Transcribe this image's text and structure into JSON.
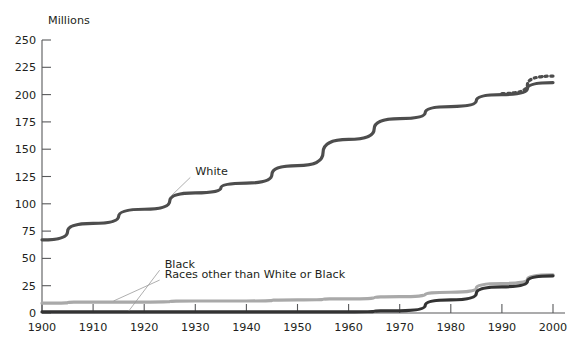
{
  "chart_data": {
    "type": "line",
    "title": "",
    "ylabel": "Millions",
    "xlabel": "",
    "ylim": [
      0,
      250
    ],
    "xlim": [
      1900,
      2000
    ],
    "grid": false,
    "legend_position": "inline-annotations",
    "x": [
      1900,
      1910,
      1920,
      1930,
      1940,
      1950,
      1960,
      1970,
      1980,
      1990,
      2000
    ],
    "yticks": [
      0,
      25,
      50,
      75,
      100,
      125,
      150,
      175,
      200,
      225,
      250
    ],
    "ytick_labels": [
      "0",
      "25",
      "50",
      "75",
      "100",
      "125",
      "150",
      "175",
      "200",
      "225",
      "250"
    ],
    "xticks": [
      1900,
      1910,
      1920,
      1930,
      1940,
      1950,
      1960,
      1970,
      1980,
      1990,
      2000
    ],
    "xtick_labels": [
      "1900",
      "1910",
      "1920",
      "1930",
      "1940",
      "1950",
      "1960",
      "1970",
      "1980",
      "1990",
      "2000"
    ],
    "series": [
      {
        "name": "White",
        "label": "White",
        "color": "#4d4d4d",
        "style": "solid",
        "width": 3.2,
        "values": [
          67,
          82,
          95,
          110,
          119,
          135,
          159,
          178,
          189,
          200,
          211
        ]
      },
      {
        "name": "White projected",
        "label": "",
        "color": "#4d4d4d",
        "style": "dotted",
        "width": 3.2,
        "values": [
          null,
          null,
          null,
          null,
          null,
          null,
          null,
          null,
          null,
          201,
          217
        ]
      },
      {
        "name": "Races other than White or Black",
        "label": "Races other than White or Black",
        "color": "#a9a9a9",
        "style": "solid",
        "width": 3.2,
        "values": [
          9,
          10,
          10,
          11,
          11,
          12,
          13,
          15,
          19,
          27,
          35
        ]
      },
      {
        "name": "Black",
        "label": "Black",
        "color": "#333333",
        "style": "solid",
        "width": 3.2,
        "values": [
          1,
          1,
          1,
          1,
          1,
          1,
          1,
          2,
          12,
          24,
          34
        ]
      }
    ],
    "annotations": [
      {
        "text": "White",
        "x": 1930,
        "y": 126,
        "target_x": 1925,
        "target_y": 106
      },
      {
        "text": "Black",
        "x": 1924,
        "y": 41,
        "target_x": 1917,
        "target_y": 2
      },
      {
        "text": "Races other than White or Black",
        "x": 1924,
        "y": 32,
        "target_x": 1914,
        "target_y": 11
      }
    ]
  }
}
